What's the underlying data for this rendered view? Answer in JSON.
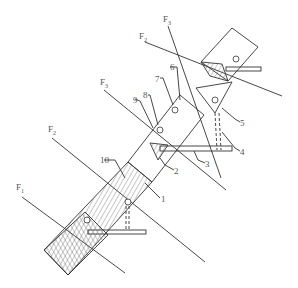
{
  "figure": {
    "type": "technical line drawing",
    "stroke_color": "#333333",
    "background": "#ffffff"
  },
  "plane_labels": [
    {
      "id": "F1",
      "base": "F",
      "sub": "1"
    },
    {
      "id": "F2_left",
      "base": "F",
      "sub": "2"
    },
    {
      "id": "F3_left",
      "base": "F",
      "sub": "3"
    },
    {
      "id": "F3_top",
      "base": "F",
      "sub": "3"
    },
    {
      "id": "F2_top",
      "base": "F",
      "sub": "2"
    }
  ],
  "part_labels": [
    "1",
    "2",
    "3",
    "4",
    "5",
    "6",
    "7",
    "8",
    "9",
    "10"
  ]
}
